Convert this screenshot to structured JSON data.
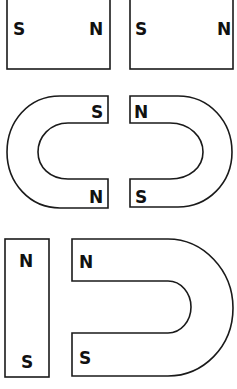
{
  "diagram": {
    "bar_magnets_top": {
      "left": {
        "pole_left": "S",
        "pole_right": "N"
      },
      "right": {
        "pole_left": "S",
        "pole_right": "N"
      }
    },
    "horseshoe_pair": {
      "left": {
        "pole_top": "S",
        "pole_bottom": "N"
      },
      "right": {
        "pole_top": "N",
        "pole_bottom": "S"
      }
    },
    "bottom_pair": {
      "bar": {
        "pole_top": "N",
        "pole_bottom": "S"
      },
      "horseshoe": {
        "pole_top": "N",
        "pole_bottom": "S"
      }
    },
    "colors": {
      "stroke": "#1a1a1a",
      "background": "#ffffff"
    }
  }
}
